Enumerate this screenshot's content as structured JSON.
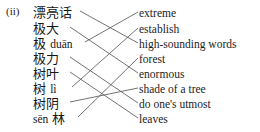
{
  "exercise": {
    "number_label": "(ii)",
    "type": "matching",
    "line_color": "#5a5a5a"
  },
  "left_column": {
    "items": [
      {
        "index": 0,
        "text": "漂亮话",
        "has_pinyin": false,
        "y": 13,
        "end_x": 80
      },
      {
        "index": 1,
        "text": "极大",
        "has_pinyin": false,
        "y": 29,
        "end_x": 70
      },
      {
        "index": 2,
        "text": "极 duān",
        "hanzi": "极",
        "pinyin": "duān",
        "has_pinyin": true,
        "y": 44,
        "end_x": 85
      },
      {
        "index": 3,
        "text": "极力",
        "has_pinyin": false,
        "y": 59,
        "end_x": 70
      },
      {
        "index": 4,
        "text": "树叶",
        "has_pinyin": false,
        "y": 74,
        "end_x": 70
      },
      {
        "index": 5,
        "text": "树 lì",
        "hanzi": "树",
        "pinyin": "lì",
        "has_pinyin": true,
        "y": 89,
        "end_x": 72
      },
      {
        "index": 6,
        "text": "树阴",
        "has_pinyin": false,
        "y": 104,
        "end_x": 70
      },
      {
        "index": 7,
        "text": "sēn 林",
        "hanzi": "林",
        "pinyin": "sēn",
        "has_pinyin": true,
        "y": 119,
        "end_x": 78
      }
    ]
  },
  "right_column": {
    "items": [
      {
        "index": 0,
        "text": "extreme",
        "y": 13
      },
      {
        "index": 1,
        "text": "establish",
        "y": 29
      },
      {
        "index": 2,
        "text": "high-sounding words",
        "y": 44
      },
      {
        "index": 3,
        "text": "forest",
        "y": 59
      },
      {
        "index": 4,
        "text": "enormous",
        "y": 74
      },
      {
        "index": 5,
        "text": "shade of a tree",
        "y": 89
      },
      {
        "index": 6,
        "text": "do one's utmost",
        "y": 104
      },
      {
        "index": 7,
        "text": "leaves",
        "y": 119
      }
    ]
  },
  "connections": [
    {
      "from": 0,
      "to": 2
    },
    {
      "from": 1,
      "to": 4
    },
    {
      "from": 2,
      "to": 0
    },
    {
      "from": 3,
      "to": 6
    },
    {
      "from": 4,
      "to": 7
    },
    {
      "from": 5,
      "to": 1
    },
    {
      "from": 6,
      "to": 5
    },
    {
      "from": 7,
      "to": 3
    }
  ]
}
